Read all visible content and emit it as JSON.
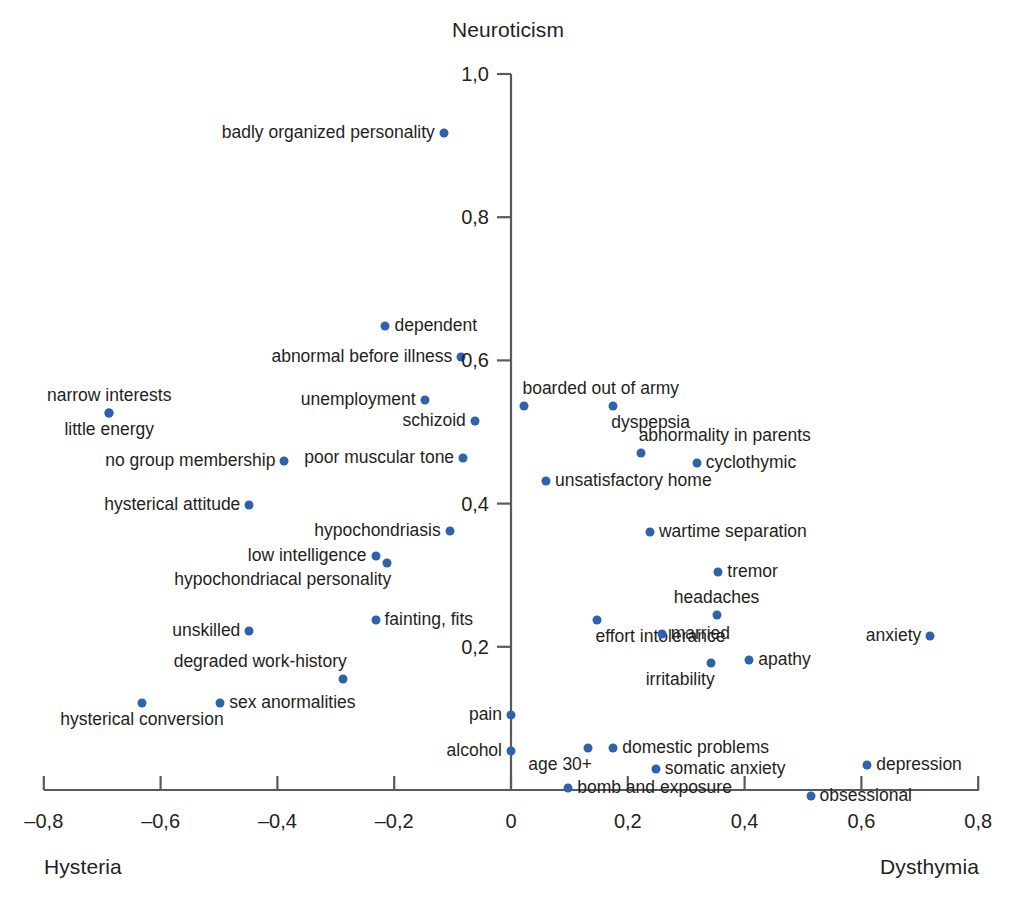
{
  "chart_data": {
    "type": "scatter",
    "title": "",
    "ylabel": "Neuroticism",
    "xlabel": "",
    "xlabel_left": "Hysteria",
    "xlabel_right": "Dysthymia",
    "xlim": [
      -0.8,
      0.8
    ],
    "ylim": [
      0.0,
      1.0
    ],
    "xticks": [
      "–0,8",
      "–0,6",
      "–0,4",
      "–0,2",
      "0",
      "0,2",
      "0,4",
      "0,6",
      "0,8"
    ],
    "xtick_values": [
      -0.8,
      -0.6,
      -0.4,
      -0.2,
      0,
      0.2,
      0.4,
      0.6,
      0.8
    ],
    "yticks": [
      "0,2",
      "0,4",
      "0,6",
      "0,8",
      "1,0"
    ],
    "ytick_values": [
      0.2,
      0.4,
      0.6,
      0.8,
      1.0
    ],
    "grid": false,
    "legend": "none",
    "point_color": "#2d62ac",
    "axis_color": "#58595b",
    "points": [
      {
        "label": "badly organized personality",
        "x": -0.115,
        "y": 0.918,
        "anchor": "left"
      },
      {
        "label": "dependent",
        "x": -0.215,
        "y": 0.648,
        "anchor": "right"
      },
      {
        "label": "abnormal before illness",
        "x": -0.085,
        "y": 0.605,
        "anchor": "left"
      },
      {
        "label": "narrow interests",
        "x": -0.688,
        "y": 0.527,
        "anchor": "above"
      },
      {
        "label": "little energy",
        "x": -0.688,
        "y": 0.527,
        "anchor": "below"
      },
      {
        "label": "unemployment",
        "x": -0.148,
        "y": 0.545,
        "anchor": "left"
      },
      {
        "label": "boarded out of army",
        "x": 0.023,
        "y": 0.537,
        "anchor": "above-right"
      },
      {
        "label": "dyspepsia",
        "x": 0.175,
        "y": 0.537,
        "anchor": "below-right"
      },
      {
        "label": "schizoid",
        "x": -0.062,
        "y": 0.515,
        "anchor": "left"
      },
      {
        "label": "abnormality in parents",
        "x": 0.222,
        "y": 0.47,
        "anchor": "above-right"
      },
      {
        "label": "cyclothymic",
        "x": 0.318,
        "y": 0.457,
        "anchor": "right"
      },
      {
        "label": "poor muscular tone",
        "x": -0.082,
        "y": 0.464,
        "anchor": "left"
      },
      {
        "label": "no group membership",
        "x": -0.388,
        "y": 0.46,
        "anchor": "left"
      },
      {
        "label": "unsatisfactory home",
        "x": 0.06,
        "y": 0.432,
        "anchor": "right"
      },
      {
        "label": "hysterical attitude",
        "x": -0.448,
        "y": 0.398,
        "anchor": "left"
      },
      {
        "label": "hypochondriasis",
        "x": -0.105,
        "y": 0.362,
        "anchor": "left"
      },
      {
        "label": "wartime separation",
        "x": 0.238,
        "y": 0.36,
        "anchor": "right"
      },
      {
        "label": "low intelligence",
        "x": -0.232,
        "y": 0.327,
        "anchor": "left"
      },
      {
        "label": "tremor",
        "x": 0.355,
        "y": 0.305,
        "anchor": "right"
      },
      {
        "label": "hypochondriacal personality",
        "x": -0.212,
        "y": 0.317,
        "anchor": "below-left"
      },
      {
        "label": "headaches",
        "x": 0.352,
        "y": 0.245,
        "anchor": "above"
      },
      {
        "label": "fainting, fits",
        "x": -0.232,
        "y": 0.237,
        "anchor": "right"
      },
      {
        "label": "effort intolerance",
        "x": 0.148,
        "y": 0.237,
        "anchor": "below-right"
      },
      {
        "label": "married",
        "x": 0.258,
        "y": 0.218,
        "anchor": "right"
      },
      {
        "label": "anxiety",
        "x": 0.718,
        "y": 0.215,
        "anchor": "left"
      },
      {
        "label": "unskilled",
        "x": -0.448,
        "y": 0.222,
        "anchor": "left"
      },
      {
        "label": "apathy",
        "x": 0.408,
        "y": 0.182,
        "anchor": "right"
      },
      {
        "label": "irritability",
        "x": 0.342,
        "y": 0.178,
        "anchor": "below-left"
      },
      {
        "label": "degraded work-history",
        "x": -0.288,
        "y": 0.155,
        "anchor": "above-left"
      },
      {
        "label": "hysterical conversion",
        "x": -0.632,
        "y": 0.122,
        "anchor": "below"
      },
      {
        "label": "sex anormalities",
        "x": -0.498,
        "y": 0.122,
        "anchor": "right"
      },
      {
        "label": "pain",
        "x": 0.0,
        "y": 0.105,
        "anchor": "left"
      },
      {
        "label": "alcohol",
        "x": 0.0,
        "y": 0.055,
        "anchor": "left"
      },
      {
        "label": "age 30+",
        "x": 0.132,
        "y": 0.058,
        "anchor": "below-left"
      },
      {
        "label": "domestic problems",
        "x": 0.175,
        "y": 0.058,
        "anchor": "right"
      },
      {
        "label": "somatic anxiety",
        "x": 0.248,
        "y": 0.03,
        "anchor": "right"
      },
      {
        "label": "depression",
        "x": 0.61,
        "y": 0.035,
        "anchor": "right"
      },
      {
        "label": "bomb and exposure",
        "x": 0.098,
        "y": 0.003,
        "anchor": "right"
      },
      {
        "label": "obsessional",
        "x": 0.513,
        "y": -0.008,
        "anchor": "right"
      }
    ]
  },
  "caption": ""
}
